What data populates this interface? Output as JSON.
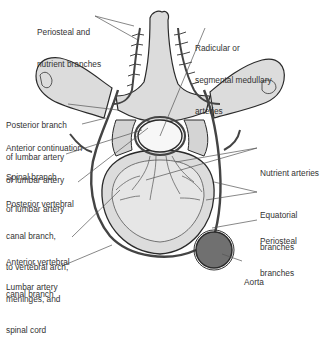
{
  "figure": {
    "colors": {
      "background": "#ffffff",
      "bone_fill": "#dcdcdc",
      "bone_fill_light": "#e6e6e6",
      "bone_outline": "#2a2a2a",
      "artery": "#5a5a5a",
      "artery_outline": "#222222",
      "aorta_fill": "#707070",
      "canal_fill": "#f7f7f7",
      "leader_line": "#555555",
      "label_text": "#333333"
    }
  },
  "labels": {
    "left": [
      {
        "id": "periosteal-nutrient",
        "lines": [
          "Periosteal and",
          "nutrient branches"
        ]
      },
      {
        "id": "posterior-branch",
        "lines": [
          "Posterior branch",
          "of lumbar artery"
        ]
      },
      {
        "id": "anterior-continuation",
        "lines": [
          "Anterior continuation",
          "of lumbar artery"
        ]
      },
      {
        "id": "spinal-branch",
        "lines": [
          "Spinal branch",
          "of lumbar artery"
        ]
      },
      {
        "id": "posterior-vertebral-canal",
        "lines": [
          "Posterior vertebral",
          "canal branch,",
          "to vertebral arch,",
          "meninges, and",
          "spinal cord"
        ]
      },
      {
        "id": "anterior-vertebral-canal",
        "lines": [
          "Anterior vertebral",
          "canal branch"
        ]
      },
      {
        "id": "lumbar-artery",
        "lines": [
          "Lumbar artery"
        ]
      }
    ],
    "right": [
      {
        "id": "radicular",
        "lines": [
          "Radicular or",
          "segmental medullary",
          "arteries"
        ]
      },
      {
        "id": "nutrient-arteries",
        "lines": [
          "Nutrient arteries"
        ]
      },
      {
        "id": "equatorial",
        "lines": [
          "Equatorial",
          "branches"
        ]
      },
      {
        "id": "periosteal",
        "lines": [
          "Periosteal",
          "branches"
        ]
      },
      {
        "id": "aorta",
        "lines": [
          "Aorta"
        ]
      }
    ]
  }
}
